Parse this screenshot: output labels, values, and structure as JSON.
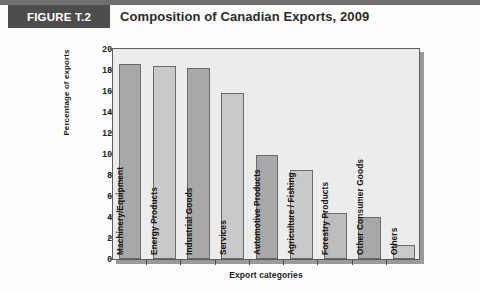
{
  "header": {
    "figure_badge": "FIGURE T.2",
    "title": "Composition of Canadian Exports, 2009"
  },
  "chart_data": {
    "type": "bar",
    "title": "Composition of Canadian Exports, 2009",
    "xlabel": "Export categories",
    "ylabel": "Percentage of exports",
    "ylim": [
      0,
      20
    ],
    "ytick_step": 2,
    "yticks": [
      "20",
      "18",
      "16",
      "14",
      "12",
      "10",
      "8",
      "6",
      "4",
      "2",
      "0"
    ],
    "grid": false,
    "legend": null,
    "categories": [
      "Machinery/Equipment",
      "Energy Products",
      "Industrial Goods",
      "Services",
      "Automotive Products",
      "Agriculture / Fishing",
      "Forestry Products",
      "Other Consumer Goods",
      "Others"
    ],
    "values": [
      18.6,
      18.4,
      18.2,
      15.8,
      9.9,
      8.5,
      4.4,
      4.0,
      1.3
    ],
    "bar_colors": [
      "#a8a8a8",
      "#c9c9c9",
      "#a8a8a8",
      "#c9c9c9",
      "#a8a8a8",
      "#c9c9c9",
      "#bdbdbd",
      "#a8a8a8",
      "#c9c9c9"
    ]
  },
  "colors": {
    "badge_background": "#4d4d4d",
    "badge_text": "#ffffff",
    "rule": "#6f6f6f",
    "plot_background": "#ececec",
    "plot_border": "#5d5d5d",
    "axis_text": "#1c1c1c"
  }
}
